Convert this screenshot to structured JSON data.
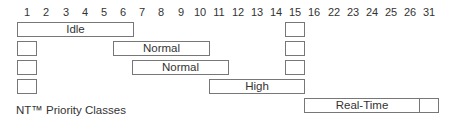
{
  "axis": {
    "ticks": [
      {
        "label": "1",
        "x": 17
      },
      {
        "label": "2",
        "x": 36
      },
      {
        "label": "3",
        "x": 56
      },
      {
        "label": "4",
        "x": 75
      },
      {
        "label": "5",
        "x": 94
      },
      {
        "label": "6",
        "x": 113
      },
      {
        "label": "7",
        "x": 132
      },
      {
        "label": "8",
        "x": 151
      },
      {
        "label": "9",
        "x": 171
      },
      {
        "label": "10",
        "x": 190
      },
      {
        "label": "11",
        "x": 209
      },
      {
        "label": "12",
        "x": 228
      },
      {
        "label": "13",
        "x": 247
      },
      {
        "label": "14",
        "x": 266
      },
      {
        "label": "15",
        "x": 285
      },
      {
        "label": "16",
        "x": 304
      },
      {
        "label": "22",
        "x": 324
      },
      {
        "label": "23",
        "x": 343
      },
      {
        "label": "24",
        "x": 362
      },
      {
        "label": "25",
        "x": 381
      },
      {
        "label": "26",
        "x": 400
      },
      {
        "label": "31",
        "x": 419
      }
    ]
  },
  "classes": [
    {
      "name": "Idle",
      "left": 17,
      "top": 22,
      "width": 117,
      "height": 15
    },
    {
      "name": "Normal",
      "left": 113,
      "top": 41,
      "width": 97,
      "height": 15
    },
    {
      "name": "Normal",
      "left": 132,
      "top": 60,
      "width": 97,
      "height": 15
    },
    {
      "name": "High",
      "left": 209,
      "top": 79,
      "width": 96,
      "height": 15
    },
    {
      "name": "Real-Time",
      "left": 304,
      "top": 98,
      "width": 116,
      "height": 15
    }
  ],
  "small_boxes": [
    {
      "left": 17,
      "top": 41
    },
    {
      "left": 17,
      "top": 60
    },
    {
      "left": 17,
      "top": 79
    },
    {
      "left": 285,
      "top": 22
    },
    {
      "left": 285,
      "top": 41
    },
    {
      "left": 285,
      "top": 60
    },
    {
      "left": 419,
      "top": 98
    }
  ],
  "caption": "NT™ Priority Classes"
}
